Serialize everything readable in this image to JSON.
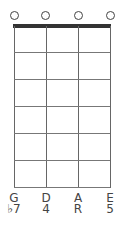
{
  "chord_diagram": {
    "strings": [
      {
        "name": "G",
        "interval": "♭7",
        "marker": "open"
      },
      {
        "name": "D",
        "interval": "4",
        "marker": "open"
      },
      {
        "name": "A",
        "interval": "R",
        "marker": "open"
      },
      {
        "name": "E",
        "interval": "5",
        "marker": "open"
      }
    ],
    "fret_count": 6,
    "colors": {
      "lines": "#666666",
      "nut": "#333333",
      "background": "#ffffff"
    }
  }
}
